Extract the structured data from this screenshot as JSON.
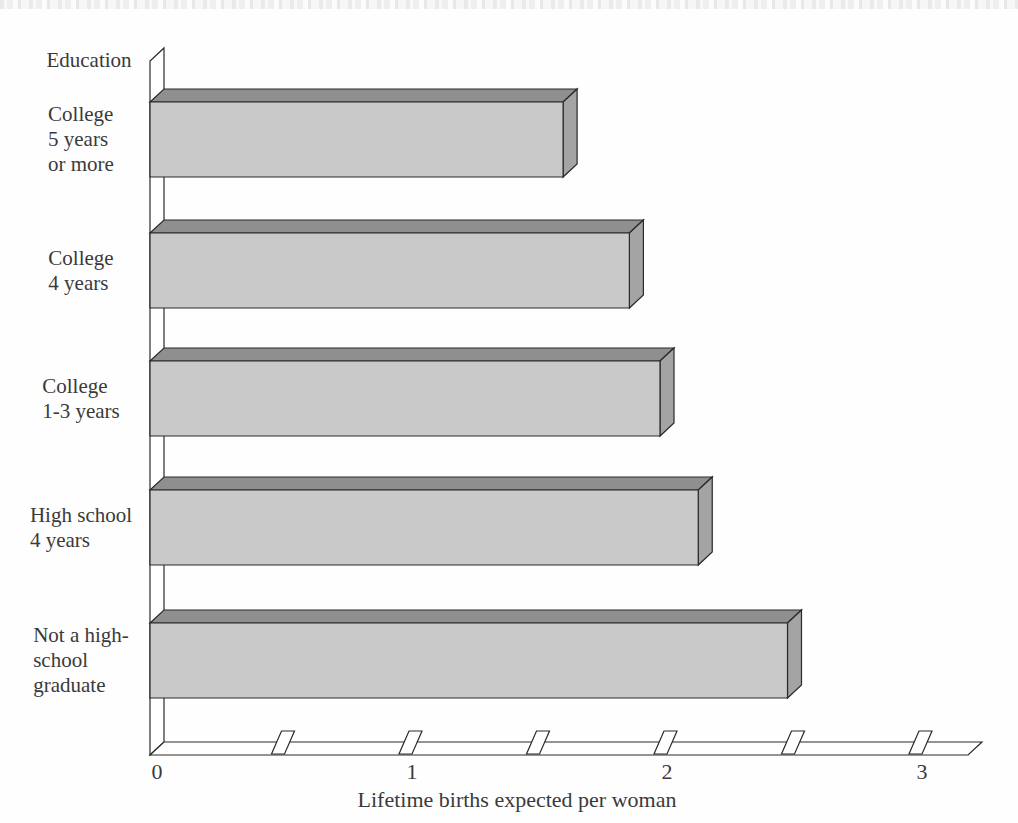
{
  "chart_data": {
    "type": "bar",
    "orientation": "horizontal",
    "style": "3d-block",
    "y_axis_title": "Education",
    "axis_label": "Lifetime births expected per woman",
    "categories": [
      "College 5 years or more",
      "College 4 years",
      "College 1-3 years",
      "High school 4 years",
      "Not a high-school graduate"
    ],
    "category_lines": [
      [
        "College",
        "5 years",
        "or more"
      ],
      [
        "College",
        "4 years"
      ],
      [
        "College",
        "1-3 years"
      ],
      [
        "High school",
        "4 years"
      ],
      [
        "Not a high-",
        "school",
        "graduate"
      ]
    ],
    "values": [
      1.62,
      1.88,
      2.0,
      2.15,
      2.5
    ],
    "xlim": [
      0,
      3.2
    ],
    "x_ticks": [
      0,
      1,
      2,
      3
    ],
    "x_tick_labels": [
      "0",
      "1",
      "2",
      "3"
    ],
    "x_minor_ticks": [
      0.5,
      1.0,
      1.5,
      2.0,
      2.5,
      3.0
    ],
    "legend": null,
    "grid": false,
    "colors": {
      "bar_face": "#c9c9c9",
      "bar_top": "#8f8f8f",
      "bar_side": "#a4a4a4",
      "axis_fill": "#ffffff",
      "line": "#2a2a2a",
      "text": "#3a3a3a"
    }
  }
}
